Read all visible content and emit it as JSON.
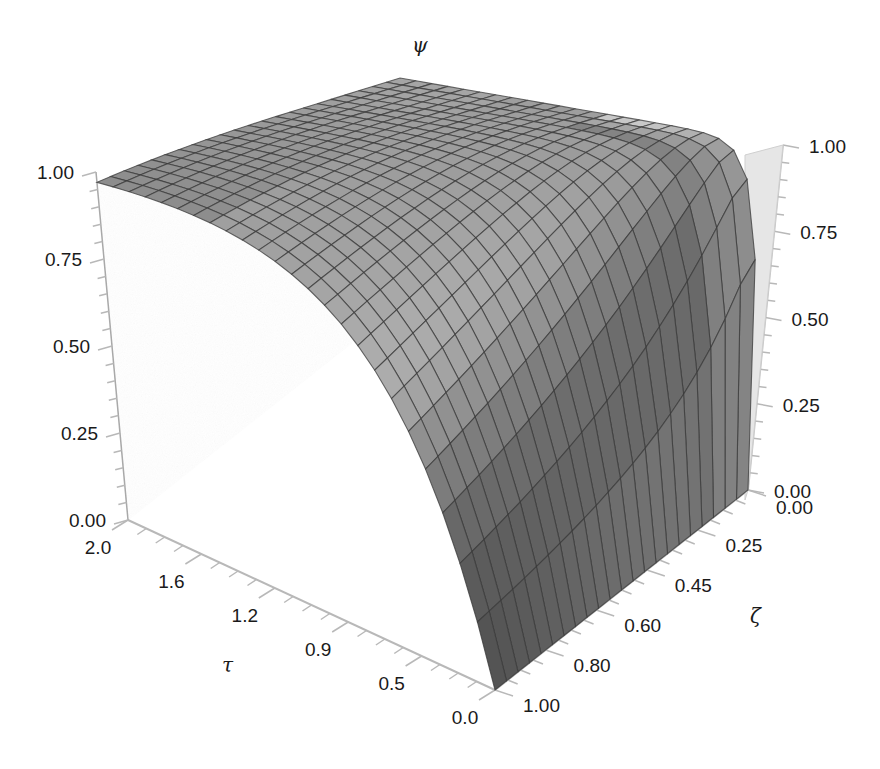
{
  "chart_data": {
    "type": "surface3d",
    "title": "",
    "axes": {
      "z": {
        "label": "ψ",
        "range": [
          0,
          1
        ],
        "ticks": [
          "0.00",
          "0.25",
          "0.50",
          "0.75",
          "1.00"
        ]
      },
      "x": {
        "label": "τ",
        "range": [
          0,
          2
        ],
        "ticks": [
          "2.0",
          "1.6",
          "1.2",
          "0.9",
          "0.5",
          "0.0"
        ]
      },
      "y": {
        "label": "ζ",
        "range": [
          0,
          1
        ],
        "ticks": [
          "0.00",
          "0.25",
          "0.45",
          "0.60",
          "0.80",
          "1.00"
        ]
      }
    },
    "right_z_ticks": [
      "1.00",
      "0.75",
      "0.50",
      "0.25",
      "0.00"
    ],
    "surface_description": "ψ rises from 0 at τ=0 toward a plateau of 1.00; steeper rise for small ζ, flat plateau across large τ",
    "mesh": {
      "tau_lines": 24,
      "zeta_lines": 22
    },
    "colors": {
      "surface_light": "#d8d8d8",
      "surface_dark": "#4a4a4a",
      "mesh_line": "#3a3a3a",
      "wall": "#bdbdbd",
      "axis": "#b8b8b8"
    }
  },
  "labels": {
    "psi": "ψ",
    "tau": "τ",
    "zeta": "ζ"
  }
}
